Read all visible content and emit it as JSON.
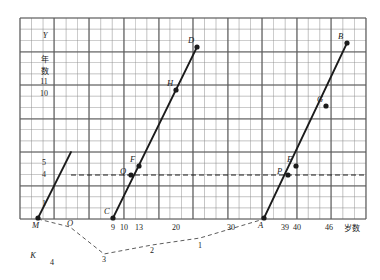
{
  "figure": {
    "type": "line-graph-on-grid",
    "background": "#ffffff",
    "grid_color": "#8c8c8c",
    "ink_color": "#1b1b1b",
    "axis_labels": {
      "y_symbol": "Y",
      "y_text_line1": "年",
      "y_text_line2": "数",
      "x_text": "岁数"
    },
    "y_ticks": [
      {
        "label": "11",
        "y": 81
      },
      {
        "label": "10",
        "y": 93
      },
      {
        "label": "5",
        "y": 162
      },
      {
        "label": "4",
        "y": 174
      },
      {
        "label": "1",
        "y": 203
      }
    ],
    "x_ticks": [
      {
        "label": "9",
        "x": 113
      },
      {
        "label": "10",
        "x": 124
      },
      {
        "label": "13",
        "x": 139
      },
      {
        "label": "20",
        "x": 176
      },
      {
        "label": "30",
        "x": 231
      },
      {
        "label": "39",
        "x": 285
      },
      {
        "label": "40",
        "x": 297
      },
      {
        "label": "46",
        "x": 329
      }
    ],
    "points": [
      {
        "name": "M",
        "x": 38,
        "y": 218,
        "label_pos": "below-left"
      },
      {
        "name": "C",
        "x": 113,
        "y": 218,
        "label_pos": "above-left"
      },
      {
        "name": "Q",
        "x": 131,
        "y": 175,
        "label_pos": "left"
      },
      {
        "name": "F",
        "x": 139,
        "y": 166,
        "label_pos": "above-left"
      },
      {
        "name": "H",
        "x": 176,
        "y": 90,
        "label_pos": "above-left"
      },
      {
        "name": "D",
        "x": 197,
        "y": 47,
        "label_pos": "above-left"
      },
      {
        "name": "A",
        "x": 264,
        "y": 218,
        "label_pos": "below-left"
      },
      {
        "name": "P",
        "x": 288,
        "y": 175,
        "label_pos": "left"
      },
      {
        "name": "E",
        "x": 296,
        "y": 166,
        "label_pos": "above-left"
      },
      {
        "name": "G",
        "x": 326,
        "y": 106,
        "label_pos": "above-left"
      },
      {
        "name": "B",
        "x": 347,
        "y": 43,
        "label_pos": "above-left"
      }
    ],
    "segments": [
      {
        "name": "segment-M",
        "from": "M",
        "to_x": 71,
        "to_y": 152
      },
      {
        "name": "segment-CD",
        "from": "C",
        "to": "D"
      },
      {
        "name": "segment-AB",
        "from": "A",
        "to": "B"
      }
    ],
    "dashed_horizontal": {
      "y": 175,
      "x1": 71,
      "x2": 366,
      "value": "4"
    },
    "below_axis_labels": [
      {
        "name": "O",
        "x": 70,
        "y": 226
      },
      {
        "name": "K",
        "x": 33,
        "y": 258
      }
    ],
    "below_axis_numbers": [
      {
        "label": "4",
        "x": 52,
        "y": 265
      },
      {
        "label": "3",
        "x": 104,
        "y": 262
      },
      {
        "label": "2",
        "x": 152,
        "y": 253
      },
      {
        "label": "1",
        "x": 200,
        "y": 248
      }
    ],
    "dashed_polyline": "38,219 70,227 104,254 152,245 200,238 264,219",
    "grid": {
      "left": 20,
      "top": 18,
      "right": 366,
      "bottom": 219,
      "cell_w": 11.53,
      "cell_h": 11.17,
      "heavy_cols": [
        20,
        54,
        89,
        124,
        159,
        193,
        228,
        262,
        297,
        331,
        366
      ],
      "heavy_rows": [
        18,
        52,
        85,
        119,
        152,
        186,
        219
      ]
    }
  },
  "chart_data": {
    "type": "line",
    "title": "",
    "xlabel": "岁数",
    "ylabel": "年数",
    "xlim": [
      0,
      50
    ],
    "ylim": [
      0,
      17
    ],
    "grid": true,
    "legend": "none",
    "series": [
      {
        "name": "M-line",
        "points": [
          [
            9,
            0
          ],
          [
            null,
            null
          ]
        ],
        "labels": [
          "M"
        ],
        "values": [
          [
            38,
            218
          ],
          [
            71,
            152
          ]
        ]
      },
      {
        "name": "C-D-line",
        "labels": [
          "C",
          "Q",
          "F",
          "H",
          "D"
        ],
        "x": [
          9,
          10,
          13,
          20,
          26
        ],
        "y": [
          0,
          4,
          5,
          11,
          15
        ]
      },
      {
        "name": "A-B-line",
        "labels": [
          "A",
          "P",
          "E",
          "G",
          "B"
        ],
        "x": [
          35,
          39,
          40,
          46,
          50
        ],
        "y": [
          0,
          4,
          5,
          10,
          15
        ]
      }
    ],
    "annotations": [
      {
        "text": "4",
        "type": "y-reference-dashed"
      },
      {
        "text": "K",
        "type": "below-axis-vertex"
      },
      {
        "text": "O",
        "type": "origin-ish"
      }
    ]
  }
}
